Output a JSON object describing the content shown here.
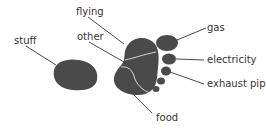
{
  "diagram": {
    "title": "",
    "colors": {
      "shape": "#4a4a4a",
      "divider": "#d9d9d9",
      "line": "#4a4a4a",
      "text": "#333333"
    },
    "labels": {
      "stuff": "stuff",
      "flying": "flying",
      "other": "other",
      "food": "food",
      "gas": "gas",
      "electricity": "electricity",
      "exhaust_pipe": "exhaust pipe"
    }
  }
}
